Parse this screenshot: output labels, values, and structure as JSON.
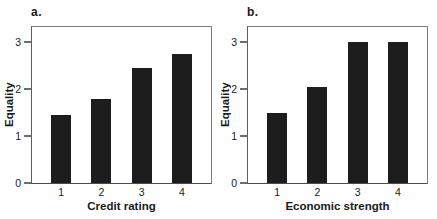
{
  "figure": {
    "background": "#fefefe",
    "text_color": "#1a1a1a",
    "frame_color": "#7d7d7d"
  },
  "chart_data": [
    {
      "type": "bar",
      "panel_label": "a.",
      "categories": [
        "1",
        "2",
        "3",
        "4"
      ],
      "values": [
        1.45,
        1.8,
        2.45,
        2.75
      ],
      "title": "",
      "xlabel": "Credit rating",
      "ylabel": "Equality",
      "yticks": [
        "0",
        "1",
        "2",
        "3"
      ],
      "ylim": [
        0,
        3.33
      ],
      "bar_color": "#1d1d1d",
      "grid": false,
      "legend": false
    },
    {
      "type": "bar",
      "panel_label": "b.",
      "categories": [
        "1",
        "2",
        "3",
        "4"
      ],
      "values": [
        1.5,
        2.05,
        3.0,
        3.0
      ],
      "title": "",
      "xlabel": "Economic strength",
      "ylabel": "Equality",
      "yticks": [
        "0",
        "1",
        "2",
        "3"
      ],
      "ylim": [
        0,
        3.33
      ],
      "bar_color": "#1d1d1d",
      "grid": false,
      "legend": false
    }
  ]
}
